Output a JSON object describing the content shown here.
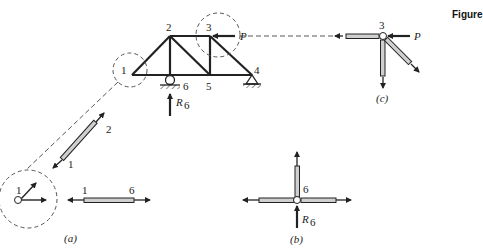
{
  "figure_label": "Figure",
  "truss": {
    "nodes": [
      {
        "id": "1",
        "x": 132,
        "y": 75
      },
      {
        "id": "2",
        "x": 170,
        "y": 36
      },
      {
        "id": "3",
        "x": 210,
        "y": 36
      },
      {
        "id": "4",
        "x": 252,
        "y": 75
      },
      {
        "id": "5",
        "x": 210,
        "y": 75
      },
      {
        "id": "6",
        "x": 170,
        "y": 75
      }
    ],
    "node_labels": {
      "n1": "1",
      "n2": "2",
      "n3": "3",
      "n4": "4",
      "n5": "5",
      "n6": "6"
    },
    "load_label": "P",
    "reaction_label": "R",
    "reaction_sub": "6"
  },
  "panel_a": {
    "caption": "(a)",
    "joint_label": "1",
    "member_12": {
      "end1": "1",
      "end2": "2"
    },
    "member_16": {
      "end1": "1",
      "end2": "6"
    }
  },
  "panel_b": {
    "caption": "(b)",
    "joint_label": "6",
    "reaction_label": "R",
    "reaction_sub": "6"
  },
  "panel_c": {
    "caption": "(c)",
    "joint_label": "3",
    "load_label": "P"
  },
  "colors": {
    "line": "#222222",
    "member_fill": "#cfcfcf",
    "dash": "#555555"
  }
}
